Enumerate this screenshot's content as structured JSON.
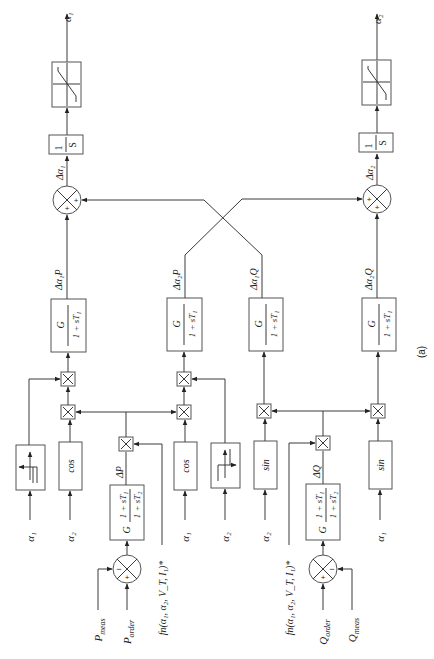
{
  "diagram": {
    "caption": "(a)",
    "outputs": {
      "alpha1": "α₁",
      "alpha2": "α₂"
    },
    "integrator": {
      "num": "1",
      "den": "S"
    },
    "summers": {
      "alpha1_sum": {
        "signs": [
          "+",
          "+"
        ],
        "output_label": "Δα₁"
      },
      "alpha2_sum": {
        "signs": [
          "+",
          "+"
        ],
        "output_label": "Δα₂"
      },
      "p_sum": {
        "signs": [
          "−",
          "+"
        ]
      },
      "q_sum": {
        "signs": [
          "+",
          "−"
        ]
      }
    },
    "lag_blocks": {
      "num": "G",
      "den": "1 + sT₁",
      "labels": [
        "Δα₁P",
        "Δα₂P",
        "Δα₁Q",
        "Δα₂Q"
      ]
    },
    "lead_lag": {
      "gain": "G",
      "num": "1 + sT₁",
      "den": "1 + sT₂"
    },
    "trig_blocks": [
      "cos",
      "cos",
      "sin",
      "sin"
    ],
    "inputs": {
      "sign1": "α₁",
      "cos1": "α₂",
      "cos2": "α₁",
      "sign2": "α₂",
      "sin1": "α₂",
      "sin2": "α₁"
    },
    "delta_p": "ΔP",
    "delta_q": "ΔQ",
    "p_meas": "P",
    "p_meas_sub": "meas",
    "p_order": "P",
    "p_order_sub": "order",
    "q_order": "Q",
    "q_order_sub": "order",
    "q_meas": "Q",
    "q_meas_sub": "meas",
    "fn_label": "fn(α₁, α₂, V_T, I₁)*"
  }
}
